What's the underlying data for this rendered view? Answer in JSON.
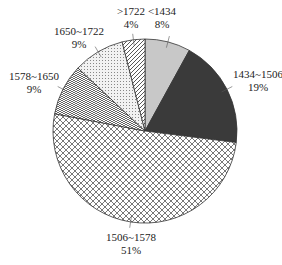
{
  "chart_data": {
    "type": "pie",
    "title": "",
    "categories": [
      "<1434",
      "1434~1506",
      "1506~1578",
      "1578~1650",
      "1650~1722",
      ">1722"
    ],
    "values": [
      8,
      19,
      51,
      9,
      9,
      4
    ],
    "value_labels": [
      "8%",
      "19%",
      "51%",
      "9%",
      "9%",
      "4%"
    ],
    "unit": "%",
    "start_angle_deg": 0,
    "direction": "clockwise",
    "legend": "none (data labels with leader lines)",
    "fills": [
      {
        "category": "<1434",
        "style": "solid",
        "color": "#c8c8c8"
      },
      {
        "category": "1434~1506",
        "style": "solid",
        "color": "#3a3a3a"
      },
      {
        "category": "1506~1578",
        "style": "crosshatch",
        "color": "#555555"
      },
      {
        "category": "1578~1650",
        "style": "weave",
        "color": "#555555"
      },
      {
        "category": "1650~1722",
        "style": "dotted",
        "color": "#777777"
      },
      {
        "category": ">1722",
        "style": "diagonal",
        "color": "#444444"
      }
    ]
  },
  "labels": [
    {
      "name": "<1434",
      "pct": "8%",
      "x": 162,
      "y": 5
    },
    {
      "name": "1434~1506",
      "pct": "19%",
      "x": 258,
      "y": 68
    },
    {
      "name": "1506~1578",
      "pct": "51%",
      "x": 131,
      "y": 231
    },
    {
      "name": "1578~1650",
      "pct": "9%",
      "x": 34,
      "y": 70
    },
    {
      "name": "1650~1722",
      "pct": "9%",
      "x": 79,
      "y": 25
    },
    {
      "name": ">1722",
      "pct": "4%",
      "x": 131,
      "y": 5
    }
  ]
}
